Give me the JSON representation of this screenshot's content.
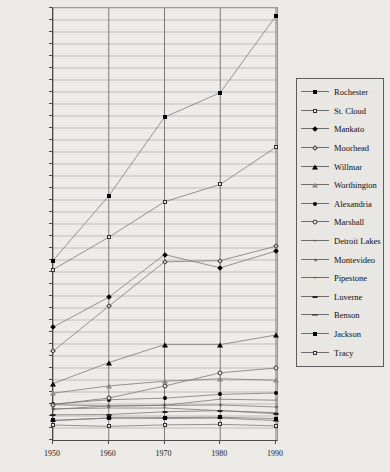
{
  "chart_data": {
    "type": "line",
    "title": "",
    "xlabel": "",
    "ylabel": "",
    "x": [
      1950,
      1960,
      1970,
      1980,
      1990
    ],
    "xtick_labels": [
      "1950",
      "1960",
      "1970",
      "1980",
      "1990"
    ],
    "ylim": [
      0,
      72000
    ],
    "ytick_step": 2000,
    "ytick_labels": [
      "0",
      "2000",
      "4000",
      "6000",
      "8000",
      "10000",
      "12000",
      "14000",
      "16000",
      "18000",
      "20000",
      "22000",
      "24000",
      "26000",
      "28000",
      "30000",
      "32000",
      "34000",
      "36000",
      "38000",
      "40000",
      "42000",
      "44000",
      "46000",
      "48000",
      "50000",
      "52000",
      "54000",
      "56000",
      "58000",
      "60000",
      "62000",
      "64000",
      "66000",
      "68000",
      "70000",
      "72000"
    ],
    "grid": true,
    "legend_position": "right",
    "series": [
      {
        "name": "Rochester",
        "marker": "filled-square",
        "values": [
          29900,
          40700,
          53800,
          57900,
          70700
        ]
      },
      {
        "name": "St. Cloud",
        "marker": "open-square",
        "values": [
          28400,
          33800,
          39700,
          42600,
          48800
        ]
      },
      {
        "name": "Mankato",
        "marker": "filled-diamond",
        "values": [
          18800,
          23800,
          30900,
          28700,
          31500
        ]
      },
      {
        "name": "Moorhead",
        "marker": "open-diamond",
        "values": [
          14800,
          22300,
          29700,
          29900,
          32300
        ]
      },
      {
        "name": "Willmar",
        "marker": "filled-triangle",
        "values": [
          9400,
          12900,
          15900,
          15900,
          17500
        ]
      },
      {
        "name": "Worthington",
        "marker": "open-triangle",
        "values": [
          7800,
          9015,
          9800,
          10200,
          9977
        ]
      },
      {
        "name": "Alexandria",
        "marker": "filled-circle",
        "values": [
          6000,
          6713,
          6973,
          7600,
          7838
        ]
      },
      {
        "name": "Marshall",
        "marker": "open-circle",
        "values": [
          5900,
          7000,
          9000,
          11200,
          12000
        ]
      },
      {
        "name": "Detroit Lakes",
        "marker": "cross",
        "values": [
          5900,
          5633,
          5797,
          6800,
          6635
        ]
      },
      {
        "name": "Montevideo",
        "marker": "asterisk",
        "values": [
          5100,
          5693,
          5765,
          5845,
          5499
        ]
      },
      {
        "name": "Pipestone",
        "marker": "plus",
        "values": [
          5200,
          5324,
          5328,
          4887,
          4554
        ]
      },
      {
        "name": "Luverne",
        "marker": "dash",
        "values": [
          4200,
          4249,
          4703,
          4899,
          4382
        ]
      },
      {
        "name": "Benson",
        "marker": "bar",
        "values": [
          3200,
          3678,
          3587,
          3656,
          3235
        ]
      },
      {
        "name": "Jackson",
        "marker": "small-filled-square",
        "values": [
          3300,
          3642,
          3733,
          3797,
          3559
        ]
      },
      {
        "name": "Tracy",
        "marker": "small-open-square",
        "values": [
          2500,
          2268,
          2516,
          2611,
          2348
        ]
      }
    ]
  },
  "legend": {
    "entries": [
      {
        "label": "Rochester"
      },
      {
        "label": "St. Cloud"
      },
      {
        "label": "Mankato"
      },
      {
        "label": "Moorhead"
      },
      {
        "label": "Willmar"
      },
      {
        "label": "Worthington"
      },
      {
        "label": "Alexandria"
      },
      {
        "label": "Marshall"
      },
      {
        "label": "Detroit Lakes"
      },
      {
        "label": "Montevideo"
      },
      {
        "label": "Pipestone"
      },
      {
        "label": "Luverne"
      },
      {
        "label": "Benson"
      },
      {
        "label": "Jackson"
      },
      {
        "label": "Tracy"
      }
    ]
  },
  "colors": {
    "background": "#eceae6",
    "plot_background": "#eeecea",
    "axis": "#4a4a4a",
    "grid": "#9d9d9d",
    "line": "#7a7a7a",
    "text": "#111111"
  }
}
